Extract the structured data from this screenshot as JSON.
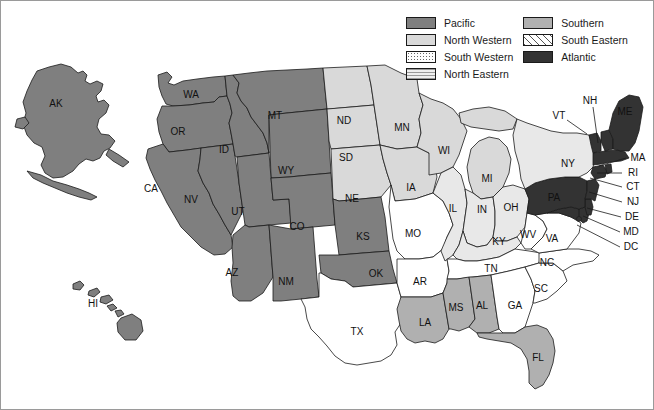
{
  "legend": {
    "columns": [
      [
        {
          "key": "pacific",
          "label": "Pacific",
          "swatch": "sw-pacific",
          "color": "#7f7f7f"
        },
        {
          "key": "north-western",
          "label": "North Western",
          "swatch": "sw-northwestern",
          "color": "#d9d9d9"
        },
        {
          "key": "south-western",
          "label": "South Western",
          "swatch": "sw-southwestern",
          "color": "#ffffff"
        },
        {
          "key": "north-eastern",
          "label": "North Eastern",
          "swatch": "sw-northeastern",
          "color": "#e8e8e8"
        }
      ],
      [
        {
          "key": "southern",
          "label": "Southern",
          "swatch": "sw-southern",
          "color": "#b0b0b0"
        },
        {
          "key": "south-eastern",
          "label": "South Eastern",
          "swatch": "sw-southeastern",
          "color": "#ffffff"
        },
        {
          "key": "atlantic",
          "label": "Atlantic",
          "swatch": "sw-atlantic",
          "color": "#333333"
        }
      ]
    ]
  },
  "map": {
    "title": "United States regional map",
    "region_assignments": {
      "pacific": [
        "AK",
        "HI",
        "WA",
        "OR",
        "CA",
        "NV",
        "ID",
        "MT",
        "WY",
        "UT",
        "CO",
        "AZ",
        "NM",
        "KS",
        "OK"
      ],
      "north-western": [
        "ND",
        "SD",
        "NE",
        "MN",
        "IA",
        "WI",
        "MI"
      ],
      "south-western": [
        "MO",
        "AR",
        "TX"
      ],
      "north-eastern": [
        "IL",
        "IN",
        "OH",
        "KY",
        "NY"
      ],
      "southern": [
        "LA",
        "MS",
        "AL",
        "FL"
      ],
      "south-eastern": [
        "TN",
        "WV",
        "VA",
        "NC",
        "SC",
        "GA"
      ],
      "atlantic": [
        "PA",
        "NJ",
        "DE",
        "MD",
        "DC",
        "CT",
        "RI",
        "MA",
        "VT",
        "NH",
        "ME"
      ]
    },
    "state_labels": [
      {
        "code": "AK",
        "x": 55,
        "y": 103
      },
      {
        "code": "HI",
        "x": 92,
        "y": 303
      },
      {
        "code": "WA",
        "x": 190,
        "y": 94
      },
      {
        "code": "OR",
        "x": 177,
        "y": 131
      },
      {
        "code": "CA",
        "x": 150,
        "y": 188
      },
      {
        "code": "NV",
        "x": 190,
        "y": 199
      },
      {
        "code": "ID",
        "x": 223,
        "y": 149
      },
      {
        "code": "MT",
        "x": 274,
        "y": 115
      },
      {
        "code": "WY",
        "x": 285,
        "y": 170
      },
      {
        "code": "UT",
        "x": 237,
        "y": 211
      },
      {
        "code": "CO",
        "x": 296,
        "y": 226
      },
      {
        "code": "AZ",
        "x": 231,
        "y": 272
      },
      {
        "code": "NM",
        "x": 285,
        "y": 281
      },
      {
        "code": "ND",
        "x": 343,
        "y": 120
      },
      {
        "code": "SD",
        "x": 345,
        "y": 157
      },
      {
        "code": "NE",
        "x": 351,
        "y": 198
      },
      {
        "code": "KS",
        "x": 362,
        "y": 236
      },
      {
        "code": "OK",
        "x": 375,
        "y": 273
      },
      {
        "code": "TX",
        "x": 356,
        "y": 331
      },
      {
        "code": "MN",
        "x": 401,
        "y": 127
      },
      {
        "code": "IA",
        "x": 410,
        "y": 187
      },
      {
        "code": "MO",
        "x": 412,
        "y": 233
      },
      {
        "code": "AR",
        "x": 419,
        "y": 281
      },
      {
        "code": "LA",
        "x": 424,
        "y": 322
      },
      {
        "code": "WI",
        "x": 443,
        "y": 150
      },
      {
        "code": "IL",
        "x": 452,
        "y": 208
      },
      {
        "code": "MS",
        "x": 455,
        "y": 307
      },
      {
        "code": "MI",
        "x": 486,
        "y": 178
      },
      {
        "code": "IN",
        "x": 481,
        "y": 209
      },
      {
        "code": "OH",
        "x": 510,
        "y": 207
      },
      {
        "code": "KY",
        "x": 498,
        "y": 241
      },
      {
        "code": "TN",
        "x": 490,
        "y": 268
      },
      {
        "code": "AL",
        "x": 481,
        "y": 305
      },
      {
        "code": "GA",
        "x": 514,
        "y": 305
      },
      {
        "code": "FL",
        "x": 537,
        "y": 357
      },
      {
        "code": "SC",
        "x": 540,
        "y": 288
      },
      {
        "code": "NC",
        "x": 546,
        "y": 262
      },
      {
        "code": "WV",
        "x": 527,
        "y": 234
      },
      {
        "code": "VA",
        "x": 551,
        "y": 238
      },
      {
        "code": "PA",
        "x": 553,
        "y": 197
      },
      {
        "code": "NY",
        "x": 567,
        "y": 163
      },
      {
        "code": "ME",
        "x": 624,
        "y": 111
      },
      {
        "code": "VT",
        "x": 558,
        "y": 115
      },
      {
        "code": "NH",
        "x": 589,
        "y": 100
      }
    ],
    "callouts": [
      {
        "code": "MA",
        "label_x": 637,
        "label_y": 157,
        "lx1": 625,
        "ly1": 157,
        "lx2": 598,
        "ly2": 165
      },
      {
        "code": "RI",
        "label_x": 632,
        "label_y": 172,
        "lx1": 621,
        "ly1": 172,
        "lx2": 596,
        "ly2": 172
      },
      {
        "code": "CT",
        "label_x": 632,
        "label_y": 186,
        "lx1": 621,
        "ly1": 186,
        "lx2": 589,
        "ly2": 177
      },
      {
        "code": "NJ",
        "label_x": 632,
        "label_y": 201,
        "lx1": 621,
        "ly1": 201,
        "lx2": 588,
        "ly2": 191
      },
      {
        "code": "DE",
        "label_x": 631,
        "label_y": 216,
        "lx1": 620,
        "ly1": 216,
        "lx2": 586,
        "ly2": 207
      },
      {
        "code": "MD",
        "label_x": 630,
        "label_y": 231,
        "lx1": 619,
        "ly1": 231,
        "lx2": 582,
        "ly2": 215
      },
      {
        "code": "DC",
        "label_x": 630,
        "label_y": 246,
        "lx1": 619,
        "ly1": 246,
        "lx2": 576,
        "ly2": 224
      },
      {
        "code": "VT",
        "label_x": 558,
        "label_y": 115,
        "lx1": 566,
        "ly1": 119,
        "lx2": 586,
        "ly2": 133
      },
      {
        "code": "NH",
        "label_x": 589,
        "label_y": 100,
        "lx1": 592,
        "ly1": 106,
        "lx2": 597,
        "ly2": 142
      }
    ]
  }
}
